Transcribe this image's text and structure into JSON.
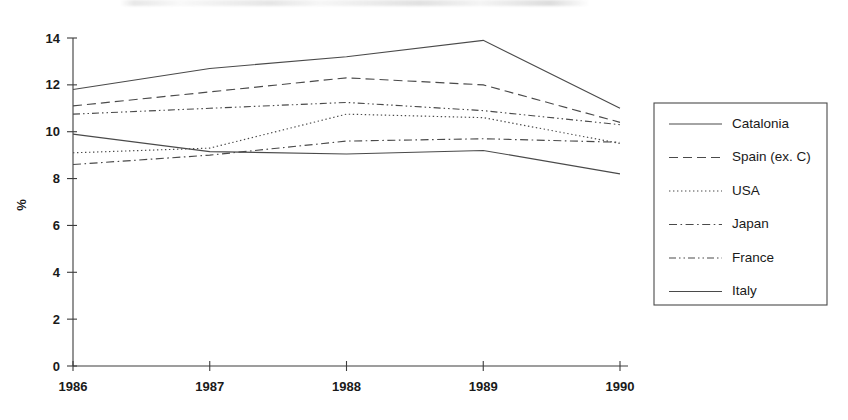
{
  "chart_data": {
    "type": "line",
    "title": "",
    "xlabel": "",
    "ylabel": "%",
    "x": [
      "1986",
      "1987",
      "1988",
      "1989",
      "1990"
    ],
    "categories": [
      "1986",
      "1987",
      "1988",
      "1989",
      "1990"
    ],
    "xlim": [
      1986,
      1990
    ],
    "ylim": [
      0,
      14
    ],
    "yticks": [
      "0",
      "2",
      "4",
      "6",
      "8",
      "10",
      "12",
      "14"
    ],
    "ytick_values": [
      0,
      2,
      4,
      6,
      8,
      10,
      12,
      14
    ],
    "grid": false,
    "legend_position": "right",
    "series": [
      {
        "name": "Catalonia",
        "style": "solid",
        "values": [
          11.8,
          12.7,
          13.2,
          13.9,
          11.0
        ]
      },
      {
        "name": "Spain (ex. C)",
        "style": "dashed",
        "values": [
          11.1,
          11.7,
          12.3,
          12.0,
          10.4
        ]
      },
      {
        "name": "USA",
        "style": "dotted",
        "values": [
          9.1,
          9.3,
          10.75,
          10.6,
          9.5
        ]
      },
      {
        "name": "Japan",
        "style": "dash-dot",
        "values": [
          8.6,
          9.0,
          9.6,
          9.7,
          9.55
        ]
      },
      {
        "name": "France",
        "style": "dash-dot-dot",
        "values": [
          10.75,
          11.0,
          11.25,
          10.9,
          10.3
        ]
      },
      {
        "name": "Italy",
        "style": "solid",
        "values": [
          9.9,
          9.15,
          9.05,
          9.2,
          8.2
        ]
      }
    ]
  },
  "colors": {
    "line": "#4a4a4a",
    "axis": "#3c3c3c",
    "text": "#1a1a1a",
    "background": "#ffffff"
  }
}
